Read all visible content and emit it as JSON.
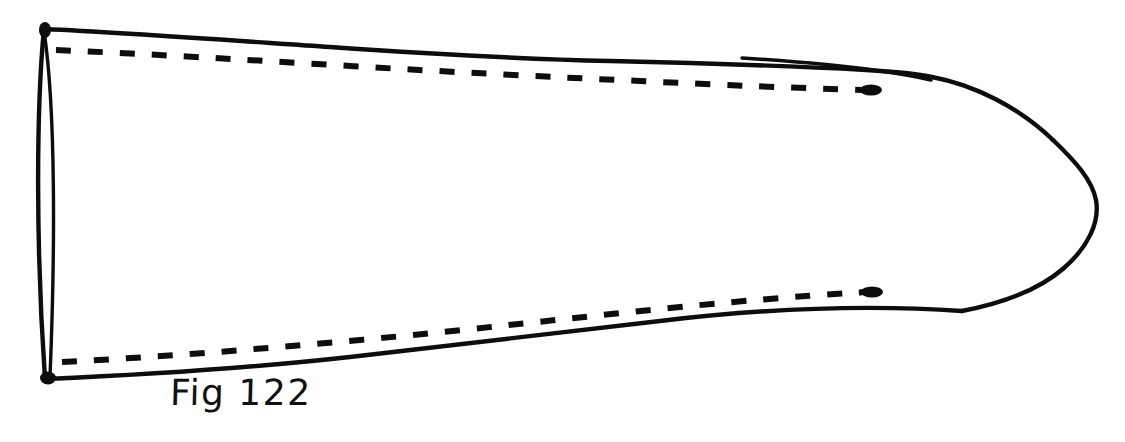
{
  "figure": {
    "caption": "Fig 122",
    "title": "Fig 122",
    "background_color": "#ffffff",
    "ink_color": "#0d0d0d",
    "canvas": {
      "width": 1125,
      "height": 442
    },
    "strokes": {
      "top_outline": "solid",
      "bottom_outline": "solid",
      "nose_dome": "solid",
      "left_opening_ellipse": "solid",
      "top_hidden_edge": "dashed",
      "bottom_hidden_edge": "dashed"
    },
    "dash_pattern": {
      "dash_length_px": 15,
      "gap_length_px": 17,
      "stroke_width_px": 6
    },
    "ink_blobs": [
      {
        "name": "top-left-corner-blob",
        "x": 44,
        "y": 29
      },
      {
        "name": "bottom-left-corner-blob",
        "x": 47,
        "y": 378
      },
      {
        "name": "top-dash-terminus-blob",
        "x": 871,
        "y": 90
      },
      {
        "name": "bottom-dash-terminus-blob",
        "x": 872,
        "y": 293
      }
    ],
    "key_points": {
      "left_opening_top": {
        "x": 43,
        "y": 28
      },
      "left_opening_bottom": {
        "x": 45,
        "y": 379
      },
      "nose_rightmost": {
        "x": 1097,
        "y": 196
      },
      "top_outline_right_merge": {
        "x": 930,
        "y": 72
      }
    }
  }
}
